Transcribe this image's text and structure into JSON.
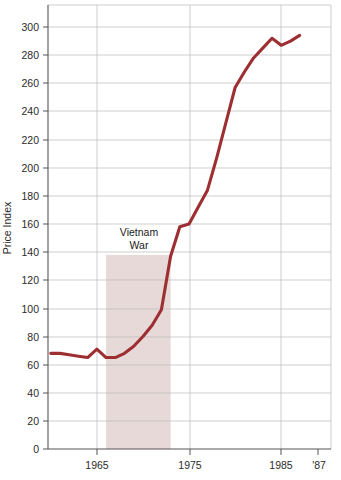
{
  "chart_data": {
    "type": "line",
    "title": "",
    "xlabel": "",
    "ylabel": "Price Index",
    "xlim": [
      1959.7,
      1990.4
    ],
    "ylim": [
      0,
      310
    ],
    "grid": true,
    "legend": false,
    "legend_position": "none",
    "line_color": "#9d2f32",
    "shading_color": "#e6d9d7",
    "grid_color": "#b9b9b9",
    "axis_color": "#555555",
    "background_color": "#ffffff",
    "y_ticks": [
      0,
      20,
      40,
      60,
      80,
      100,
      120,
      140,
      160,
      180,
      200,
      220,
      240,
      260,
      280,
      300
    ],
    "y_tick_labels": [
      "0",
      "20",
      "40",
      "60",
      "80",
      "100",
      "120",
      "140",
      "160",
      "180",
      "200",
      "220",
      "240",
      "260",
      "280",
      "300"
    ],
    "x_ticks": [
      1965,
      1975,
      1985,
      1987
    ],
    "x_tick_labels": [
      "1965",
      "1975",
      "1985",
      "'87"
    ],
    "x_gridlines": [
      1965,
      1975,
      1985
    ],
    "x": [
      1960,
      1961,
      1962,
      1963,
      1964,
      1965,
      1966,
      1967,
      1968,
      1969,
      1970,
      1971,
      1972,
      1973,
      1974,
      1975,
      1976,
      1977,
      1978,
      1979,
      1980,
      1981,
      1982,
      1983,
      1984,
      1985,
      1986,
      1987
    ],
    "values": [
      68,
      68,
      67,
      66,
      65,
      71,
      65,
      65,
      68,
      73,
      80,
      88,
      99,
      137,
      158,
      160,
      172,
      184,
      207,
      232,
      257,
      268,
      278,
      285,
      292,
      287,
      290,
      294
    ],
    "series": [
      {
        "name": "Price Index",
        "values": [
          68,
          68,
          67,
          66,
          65,
          71,
          65,
          65,
          68,
          73,
          80,
          88,
          99,
          137,
          158,
          160,
          172,
          184,
          207,
          232,
          257,
          268,
          278,
          285,
          292,
          287,
          290,
          294
        ]
      }
    ],
    "annotations": [
      {
        "name": "vietnam-war-span",
        "label_line1": "Vietnam",
        "label_line2": "War",
        "x_start": 1966,
        "x_end": 1973,
        "y_top": 138,
        "y_bottom": 0
      }
    ]
  }
}
